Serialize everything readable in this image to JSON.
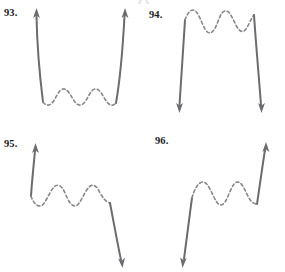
{
  "page": {
    "background_color": "#ffffff",
    "line_color": "#6b6b70",
    "dash_color": "#86868b",
    "label_color": "#1c1c1c"
  },
  "panels": [
    {
      "id": "93",
      "label": "93.",
      "description": "U-shaped graph: solid arrow rising at left end, dashed oscillating valley across the middle, solid arrow rising at right end",
      "left_end": "up",
      "right_end": "up",
      "middle": "dashed-oscillation",
      "oscillation_peaks": 2,
      "oscillation_valleys": 3
    },
    {
      "id": "94",
      "label": "94.",
      "description": "Inverted U graph: solid arrow falling at left end, dashed oscillating ridge across the top middle, solid arrow falling at right end",
      "left_end": "down",
      "right_end": "down",
      "middle": "dashed-oscillation",
      "oscillation_peaks": 3,
      "oscillation_valleys": 2
    },
    {
      "id": "95",
      "label": "95.",
      "description": "Solid arrow rising at left end, dashed oscillation across the middle, solid arrow falling at right end",
      "left_end": "up",
      "right_end": "down",
      "middle": "dashed-oscillation",
      "oscillation_peaks": 2,
      "oscillation_valleys": 2
    },
    {
      "id": "96",
      "label": "96.",
      "description": "Solid arrow falling at left end, dashed oscillation across the middle, solid arrow rising at right end",
      "left_end": "down",
      "right_end": "up",
      "middle": "dashed-oscillation",
      "oscillation_peaks": 2,
      "oscillation_valleys": 2
    }
  ]
}
